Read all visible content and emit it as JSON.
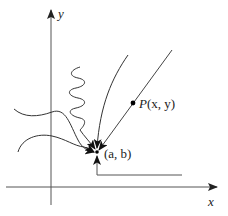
{
  "figure": {
    "colors": {
      "axis": "#555555",
      "path": "#333333",
      "point": "#000000",
      "background": "#ffffff"
    },
    "axes": {
      "x_label": "x",
      "y_label": "y"
    },
    "limit_point": {
      "label": "(a, b)"
    },
    "moving_point": {
      "label_prefix": "P",
      "label_args": "(x, y)"
    },
    "paths": [
      {
        "name": "straight-line-through-P",
        "style": "straight"
      },
      {
        "name": "curved-path-from-above",
        "style": "curve"
      },
      {
        "name": "squiggly-path-from-above",
        "style": "oscillating"
      },
      {
        "name": "wavy-path-from-left-upper",
        "style": "wave"
      },
      {
        "name": "wavy-path-from-left-lower",
        "style": "wave"
      },
      {
        "name": "staircase-path-from-below",
        "style": "polyline"
      }
    ]
  }
}
